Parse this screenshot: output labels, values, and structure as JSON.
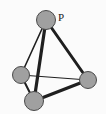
{
  "figure": {
    "width": 106,
    "height": 114,
    "background_color": "#fbfbfb",
    "border_color": "#d8d8d8"
  },
  "style": {
    "node_fill": "#a0a0a0",
    "node_stroke": "#4a4a4a",
    "edge_color": "#1f1f1f",
    "label_color": "#1a1a1a"
  },
  "graph_data": {
    "type": "diagram",
    "nodes": [
      {
        "id": "P",
        "label": "P",
        "cx": 46,
        "cy": 20,
        "r": 9.5,
        "label_x": 61,
        "label_y": 18
      },
      {
        "id": "L",
        "label": "",
        "cx": 21,
        "cy": 75,
        "r": 8.5,
        "label_x": 0,
        "label_y": 0
      },
      {
        "id": "R",
        "label": "",
        "cx": 88,
        "cy": 80,
        "r": 8.5,
        "label_x": 0,
        "label_y": 0
      },
      {
        "id": "B",
        "label": "",
        "cx": 34,
        "cy": 101,
        "r": 9.5,
        "label_x": 0,
        "label_y": 0
      }
    ],
    "edges": [
      {
        "from": "P",
        "to": "L",
        "width": 1.6
      },
      {
        "from": "P",
        "to": "B",
        "width": 3.2
      },
      {
        "from": "P",
        "to": "R",
        "width": 3.0
      },
      {
        "from": "L",
        "to": "R",
        "width": 1.2
      },
      {
        "from": "L",
        "to": "B",
        "width": 2.0
      },
      {
        "from": "B",
        "to": "R",
        "width": 3.2
      }
    ]
  }
}
